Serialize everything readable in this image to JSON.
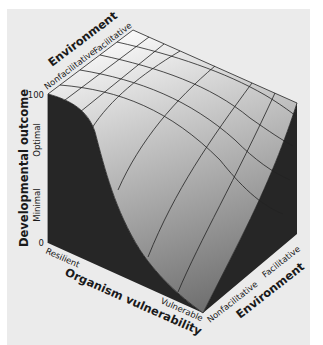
{
  "figure": {
    "type": "3d-surface",
    "background": "#ebebeb",
    "surface_color_light": "#f7f7f7",
    "surface_color_dark": "#7a7a7a",
    "side_color": "#262626"
  },
  "axes": {
    "z": {
      "title": "Developmental outcome",
      "ticks": [
        "100",
        "0"
      ],
      "level_labels": [
        "Optimal",
        "Minimal"
      ]
    },
    "environment_back": {
      "title": "Environment",
      "ticks": [
        "Nonfacilitative",
        "Facilitative"
      ]
    },
    "organism": {
      "title": "Organism vulnerability",
      "ticks": [
        "Resilient",
        "Vulnerable"
      ]
    },
    "environment_front": {
      "title": "Environment",
      "ticks": [
        "Nonfacilitative",
        "Facilitative"
      ]
    }
  }
}
